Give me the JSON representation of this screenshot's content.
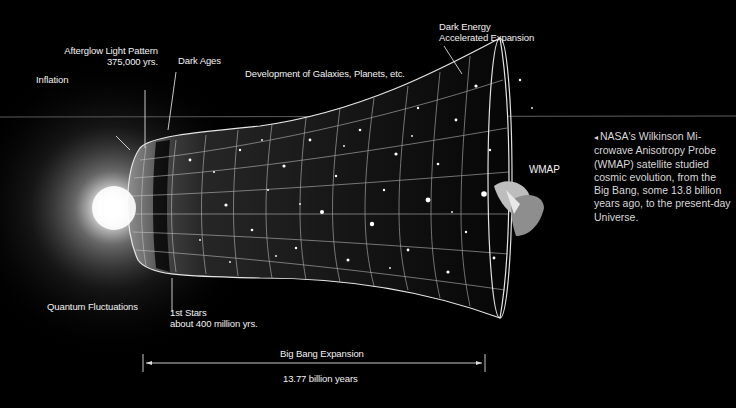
{
  "diagram": {
    "labels": {
      "afterglow_title": "Afterglow Light Pattern",
      "afterglow_age": "375,000 yrs.",
      "inflation": "Inflation",
      "dark_ages": "Dark Ages",
      "galaxies": "Development of Galaxies, Planets, etc.",
      "dark_energy_1": "Dark Energy",
      "dark_energy_2": "Accelerated Expansion",
      "wmap": "WMAP",
      "quantum": "Quantum Fluctuations",
      "first_stars_1": "1st Stars",
      "first_stars_2": "about 400 million yrs.",
      "expansion": "Big Bang Expansion",
      "duration": "13.77 billion years"
    },
    "caption": {
      "arrow_icon": "◂",
      "text": "NASA's Wilkinson Mi-crowave Anisotropy Probe (WMAP) satellite studied cosmic evolution, from the Big Bang, some 13.8 billion years ago, to the present-day Universe."
    },
    "colors": {
      "background": "#000000",
      "text": "#f2f2f2",
      "grid": "#d0d0d0",
      "glow": "#ffffff"
    }
  }
}
